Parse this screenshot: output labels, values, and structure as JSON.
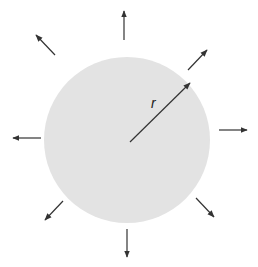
{
  "diagram": {
    "circle": {
      "cx": 127,
      "cy": 140,
      "r": 83,
      "fill": "#e3e3e3"
    },
    "radius_label": "r",
    "radius_line": {
      "x1": 130,
      "y1": 142,
      "x2": 190,
      "y2": 83
    },
    "arrows": [
      {
        "name": "arrow-up",
        "x1": 124,
        "y1": 40,
        "x2": 124,
        "y2": 11
      },
      {
        "name": "arrow-up-right",
        "x1": 188,
        "y1": 70,
        "x2": 207,
        "y2": 50
      },
      {
        "name": "arrow-right",
        "x1": 219,
        "y1": 130,
        "x2": 247,
        "y2": 130
      },
      {
        "name": "arrow-down-right",
        "x1": 196,
        "y1": 198,
        "x2": 214,
        "y2": 217
      },
      {
        "name": "arrow-down",
        "x1": 127,
        "y1": 229,
        "x2": 127,
        "y2": 257
      },
      {
        "name": "arrow-down-left",
        "x1": 63,
        "y1": 201,
        "x2": 45,
        "y2": 220
      },
      {
        "name": "arrow-left",
        "x1": 41,
        "y1": 138,
        "x2": 13,
        "y2": 138
      },
      {
        "name": "arrow-up-left",
        "x1": 55,
        "y1": 55,
        "x2": 36,
        "y2": 35
      }
    ],
    "colors": {
      "arrow": "#333333",
      "circle": "#e3e3e3"
    }
  }
}
